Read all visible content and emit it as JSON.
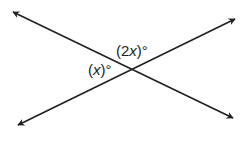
{
  "diagram": {
    "type": "intersecting-lines",
    "stroke_color": "#231f20",
    "background": "#ffffff",
    "lines": [
      {
        "name": "line-descending",
        "from": [
          13,
          12
        ],
        "to": [
          233,
          118
        ]
      },
      {
        "name": "line-ascending",
        "from": [
          18,
          125
        ],
        "to": [
          235,
          19
        ]
      }
    ],
    "intersection": [
      131,
      69
    ],
    "angle_labels": [
      {
        "name": "top-angle",
        "open": "(",
        "num": "2",
        "var": "x",
        "close": ")",
        "deg": "°"
      },
      {
        "name": "left-angle",
        "open": "(",
        "num": "",
        "var": "x",
        "close": ")",
        "deg": "°"
      }
    ]
  }
}
